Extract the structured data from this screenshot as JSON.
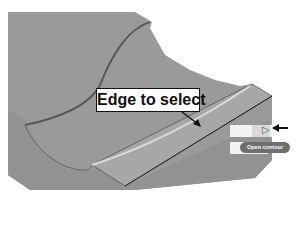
{
  "figure": {
    "type": "cad-surface-illustration",
    "callout": {
      "label": "Edge to select"
    },
    "toolbar": {
      "tooltip": "Open contour",
      "pointer_arrow": "arrow-left-icon"
    },
    "colors": {
      "surface": "#9a9a9a",
      "surface_dark": "#8a8a8a",
      "edge_highlight": "#d8d8d8",
      "curve": "#555555",
      "outline": "#222222",
      "tooltip_bg": "#6e6e6e"
    }
  }
}
